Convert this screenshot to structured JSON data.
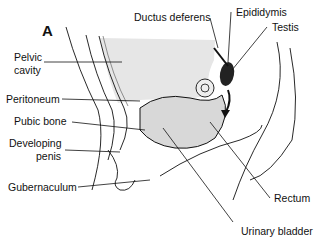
{
  "diagram": {
    "panel_label": "A",
    "labels": {
      "ductus_deferens": "Ductus deferens",
      "epididymis": "Epididymis",
      "testis": "Testis",
      "pelvic_cavity_line1": "Pelvic",
      "pelvic_cavity_line2": "cavity",
      "peritoneum": "Peritoneum",
      "pubic_bone": "Pubic bone",
      "developing_penis_line1": "Developing",
      "developing_penis_line2": "penis",
      "gubernaculum": "Gubernaculum",
      "rectum": "Rectum",
      "urinary_bladder": "Urinary bladder"
    },
    "colors": {
      "shading": "#e2e2e2",
      "line": "#111111",
      "testis": "#222222"
    }
  }
}
